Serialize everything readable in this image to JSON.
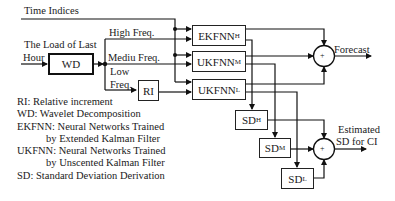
{
  "diagram": {
    "inputs": {
      "time_indices": "Time Indices",
      "load_line1": "The Load of Last",
      "load_line2": "Hour"
    },
    "branches": {
      "high": "High Freq.",
      "medium": "Mediu Freq.",
      "low_line1": "Low",
      "low_line2": "Freq."
    },
    "blocks": {
      "wd": "WD",
      "ri": "RI",
      "ekfnn_h": {
        "base": "EKFNN",
        "sub": "H"
      },
      "ukfnn_m": {
        "base": "UKFNN",
        "sub": "M"
      },
      "ukfnn_l": {
        "base": "UKFNN",
        "sub": "L"
      },
      "sd_h": {
        "base": "SD",
        "sub": "H"
      },
      "sd_m": {
        "base": "SD",
        "sub": "M"
      },
      "sd_l": {
        "base": "SD",
        "sub": "L"
      }
    },
    "summers": {
      "forecast_symbol": "+",
      "sd_symbol": "+"
    },
    "outputs": {
      "forecast": "Forecast",
      "estimated_line1": "Estimated",
      "estimated_line2": "SD for CI"
    },
    "legend": [
      {
        "text": "RI: Relative increment",
        "indent": false
      },
      {
        "text": "WD: Wavelet Decomposition",
        "indent": false
      },
      {
        "text": "EKFNN: Neural Networks Trained",
        "indent": false
      },
      {
        "text": "by Extended Kalman Filter",
        "indent": true
      },
      {
        "text": "UKFNN: Neural Networks Trained",
        "indent": false
      },
      {
        "text": "by Unscented Kalman Filter",
        "indent": true
      },
      {
        "text": "SD: Standard Deviation Derivation",
        "indent": false
      }
    ]
  }
}
